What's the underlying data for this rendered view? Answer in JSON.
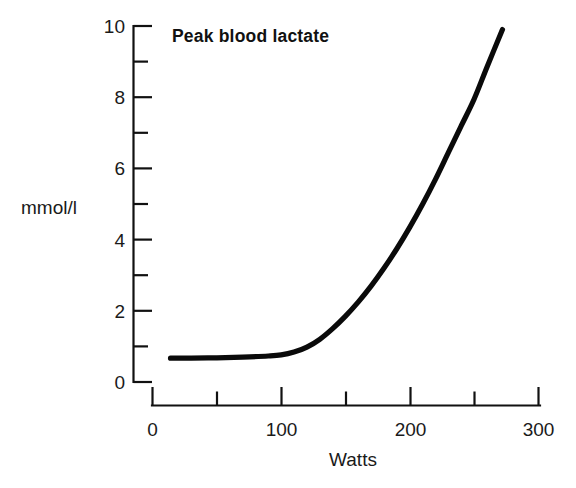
{
  "chart_data": {
    "type": "line",
    "title": "Peak blood lactate",
    "xlabel": "Watts",
    "ylabel": "mmol/l",
    "xlim": [
      0,
      300
    ],
    "ylim": [
      0,
      10
    ],
    "grid": false,
    "legend": null,
    "x_ticks_major": [
      0,
      100,
      200,
      300
    ],
    "x_ticks_major_labels": [
      "0",
      "100",
      "200",
      "300"
    ],
    "x_ticks_minor": [
      50,
      150,
      250
    ],
    "y_ticks_major": [
      0,
      2,
      4,
      6,
      8,
      10
    ],
    "y_ticks_major_labels": [
      "0",
      "2",
      "4",
      "6",
      "8",
      "10"
    ],
    "y_ticks_minor": [
      1,
      3,
      5,
      7,
      9
    ],
    "series": [
      {
        "name": "Peak blood lactate",
        "color": "#0a0a0a",
        "x": [
          14,
          30,
          50,
          70,
          90,
          100,
          110,
          120,
          130,
          140,
          150,
          160,
          170,
          180,
          190,
          200,
          210,
          220,
          230,
          240,
          250,
          260,
          272
        ],
        "values": [
          0.67,
          0.67,
          0.68,
          0.7,
          0.73,
          0.76,
          0.84,
          0.98,
          1.2,
          1.5,
          1.85,
          2.25,
          2.7,
          3.2,
          3.75,
          4.35,
          5.0,
          5.7,
          6.45,
          7.2,
          7.95,
          8.85,
          9.9
        ]
      }
    ]
  },
  "labels": {
    "y_axis_caption": "mmol/l",
    "x_axis_caption": "Watts",
    "plot_title": "Peak blood lactate"
  }
}
